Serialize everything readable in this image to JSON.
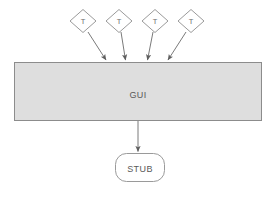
{
  "diagram": {
    "type": "architecture-flow-diagram",
    "colors": {
      "box_fill": "#dedede",
      "box_stroke": "#8c8c8c",
      "node_fill": "#ffffff",
      "node_stroke": "#9a9a9a",
      "arrow": "#7a7a7a",
      "text": "#595959",
      "background": "#ffffff"
    },
    "test_nodes": [
      {
        "label": "T",
        "cx": 83,
        "cy": 21,
        "rx": 13,
        "ry": 11.5,
        "arrow_to_x": 107
      },
      {
        "label": "T",
        "cx": 119,
        "cy": 21,
        "rx": 13,
        "ry": 11.5,
        "arrow_to_x": 126
      },
      {
        "label": "T",
        "cx": 155,
        "cy": 21,
        "rx": 13,
        "ry": 11.5,
        "arrow_to_x": 147
      },
      {
        "label": "T",
        "cx": 191,
        "cy": 21,
        "rx": 13,
        "ry": 11.5,
        "arrow_to_x": 167
      }
    ],
    "gui_box": {
      "label": "GUI",
      "x": 14,
      "y": 62,
      "width": 248,
      "height": 59,
      "label_cx": 138,
      "label_cy": 95
    },
    "stub_node": {
      "label": "STUB",
      "x": 115,
      "y": 153,
      "width": 50,
      "height": 29,
      "radius": 11,
      "label_cx": 140,
      "label_cy": 171
    },
    "gui_to_stub_arrow": {
      "x": 138,
      "y_start": 121,
      "y_end": 153
    }
  }
}
